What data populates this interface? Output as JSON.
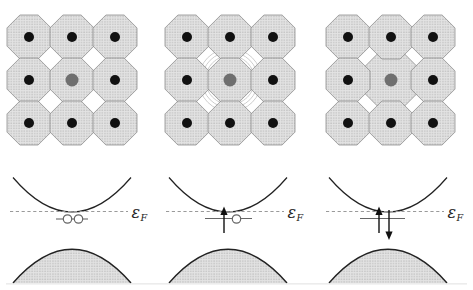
{
  "figure": {
    "fermi_label": {
      "symbol": "ε",
      "subscript": "F"
    },
    "panels": [
      {
        "name": "panel-empty-level",
        "distortion": "none",
        "occupancy": "empty",
        "electrons_in_level": 0,
        "lattice_note": "undistorted host lattice, substitutional impurity atom at center",
        "level_note": "empty defect level at the Fermi energy shown as two open circles"
      },
      {
        "name": "panel-one-electron",
        "distortion": "weak",
        "occupancy": "single",
        "electrons_in_level": 1,
        "lattice_note": "weak breathing relaxation around impurity (hatched arcs in gaps)",
        "level_note": "one spin-up electron plus one empty state just below the Fermi energy"
      },
      {
        "name": "panel-two-electrons",
        "distortion": "strong",
        "occupancy": "double",
        "electrons_in_level": 2,
        "lattice_note": "strong relaxation, enlarged impurity cell overlapping neighbors",
        "level_note": "spin-up and spin-down electrons occupying the level below the Fermi energy"
      }
    ],
    "bands": {
      "upper": "conduction band (empty parabola touching the Fermi level)",
      "lower": "valence band (shaded filled dome)"
    },
    "colors": {
      "background": "#ffffff",
      "stipple_bg": "#e3e3e3",
      "stipple_dot": "#979797",
      "atom_outline": "#7f7f7f",
      "host_dot": "#111111",
      "impurity_dot": "#6f6f6f",
      "curve": "#222222",
      "fermi_dash": "#9a9a9a",
      "level": "#666666",
      "halo_arc": "#c2c2c2",
      "baseline": "#e0e0e0"
    }
  }
}
